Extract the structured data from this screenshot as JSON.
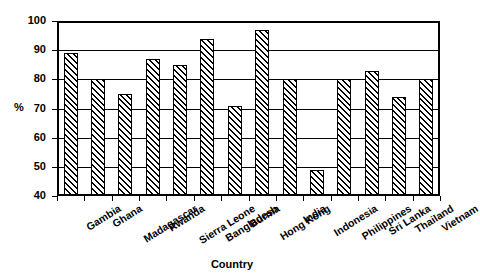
{
  "chart_data": {
    "type": "bar",
    "title": "",
    "subtitle": "",
    "xlabel": "Country",
    "ylabel": "%",
    "ylim": [
      40,
      100
    ],
    "ytick_values": [
      40,
      50,
      60,
      70,
      80,
      90,
      100
    ],
    "ytick_labels": [
      "40",
      "50",
      "60",
      "70",
      "80",
      "90",
      "100"
    ],
    "grid": true,
    "grid_axis": "y",
    "legend": false,
    "legend_position": "none",
    "bar_style": {
      "fill": "diagonal-hatch",
      "hatch_color": "#000000",
      "background_color": "#ffffff",
      "edge_color": "#000000"
    },
    "categories": [
      "Gambia",
      "Ghana",
      "Madagascar",
      "Rwanda",
      "Sierra Leone",
      "Bangladesh",
      "Burma",
      "Hong Kong",
      "India",
      "Indonesia",
      "Philippines",
      "Sri Lanka",
      "Thailand",
      "Vietnam"
    ],
    "values": [
      89,
      80,
      75,
      87,
      85,
      94,
      71,
      97,
      80,
      49,
      80,
      83,
      74,
      80
    ]
  }
}
